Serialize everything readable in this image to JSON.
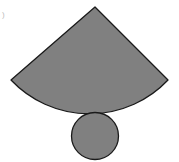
{
  "figure": {
    "label": ")",
    "colors": {
      "fill": "#808080",
      "stroke": "#1a1a1a",
      "background": "#ffffff"
    },
    "sector": {
      "apex": [
        95,
        7
      ],
      "left_point": [
        11,
        80
      ],
      "right_point": [
        168,
        80
      ],
      "arc_bottom": [
        95,
        112
      ],
      "description": "circular sector (lateral surface)"
    },
    "circle": {
      "center": [
        95,
        136
      ],
      "radius": 23.5,
      "description": "circular base"
    }
  }
}
